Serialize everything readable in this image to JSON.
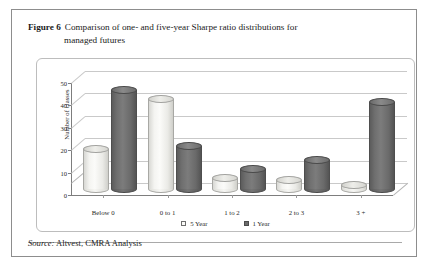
{
  "figure": {
    "label": "Figure 6",
    "title_line1": "Comparison of one- and five-year Sharpe ratio distributions for",
    "title_line2": "managed futures",
    "source_label": "Source:",
    "source_text": "Altvest, CMRA Analysis"
  },
  "chart_data": {
    "type": "bar",
    "title": "Comparison of one- and five-year Sharpe ratio distributions for managed futures",
    "xlabel": "",
    "ylabel": "Number of classes",
    "categories": [
      "Below 0",
      "0 to 1",
      "1 to 2",
      "2 to 3",
      "3 +"
    ],
    "series": [
      {
        "name": "5 Year",
        "color": "#fbfbf9",
        "values": [
          18,
          40,
          5,
          4,
          2
        ]
      },
      {
        "name": "1 Year",
        "color": "#6b6b6b",
        "values": [
          44,
          19,
          9,
          13,
          39
        ]
      }
    ],
    "ylim": [
      0,
      50
    ],
    "yticks": [
      0,
      10,
      20,
      30,
      40,
      50
    ],
    "ytick_labels": [
      "0",
      "10",
      "20",
      "30",
      "40",
      "50"
    ],
    "grid": true,
    "legend_position": "bottom",
    "style": "3d-cylinder"
  }
}
